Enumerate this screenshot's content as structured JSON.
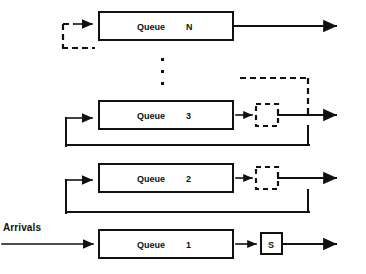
{
  "diagram": {
    "colors": {
      "ink": "#111111",
      "background": "#ffffff"
    },
    "labels": {
      "arrivals": "Arrivals",
      "queue_word": "Queue",
      "server_solid": "S",
      "ellipsis": "⋮"
    },
    "queues": [
      {
        "name": "Queue",
        "index": "N",
        "server_type": "none",
        "server_label": "",
        "feedback": "dashed",
        "departure": "solid"
      },
      {
        "name": "Queue",
        "index": "3",
        "server_type": "dashed",
        "server_label": "",
        "feedback": "solid",
        "departure": "solid"
      },
      {
        "name": "Queue",
        "index": "2",
        "server_type": "dashed",
        "server_label": "",
        "feedback": "solid",
        "departure": "solid"
      },
      {
        "name": "Queue",
        "index": "1",
        "server_type": "solid",
        "server_label": "S",
        "feedback": "none",
        "departure": "solid"
      }
    ]
  }
}
